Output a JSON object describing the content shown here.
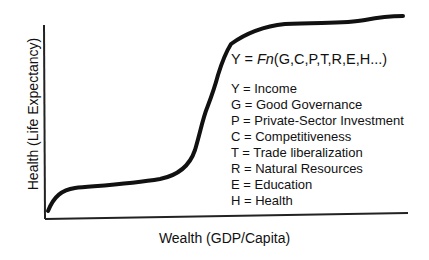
{
  "diagram": {
    "type": "concept-curve",
    "x_axis_label": "Wealth (GDP/Capita)",
    "y_axis_label": "Health (Life Expectancy)",
    "formula": {
      "lhs": "Y = ",
      "fn": "Fn",
      "args": "(G,C,P,T,R,E,H...)"
    },
    "legend": [
      {
        "symbol": "Y",
        "text": "Y = Income"
      },
      {
        "symbol": "G",
        "text": "G = Good Governance"
      },
      {
        "symbol": "P",
        "text": "P = Private-Sector Investment"
      },
      {
        "symbol": "C",
        "text": "C = Competitiveness"
      },
      {
        "symbol": "T",
        "text": "T = Trade liberalization"
      },
      {
        "symbol": "R",
        "text": "R = Natural Resources"
      },
      {
        "symbol": "E",
        "text": "E = Education"
      },
      {
        "symbol": "H",
        "text": "H = Health"
      }
    ],
    "curve_description": "S-shaped curve: rapid initial rise, long shallow plateau, steep middle rise, upper plateau",
    "colors": {
      "line": "#111111",
      "background": "#ffffff"
    }
  }
}
